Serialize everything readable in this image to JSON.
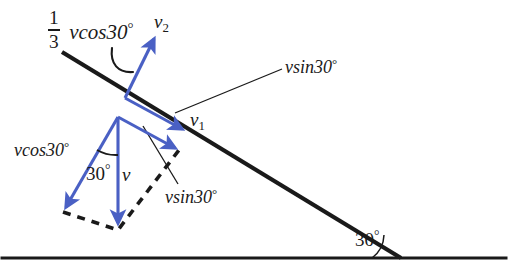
{
  "figure": {
    "width": 508,
    "height": 278,
    "background": "#ffffff"
  },
  "colors": {
    "vector_blue": "#4a60c4",
    "line_black": "#1a1a1a",
    "text": "#1a1a1a",
    "background": "#ffffff"
  },
  "labels": {
    "coefficient_numerator": "1",
    "coefficient_denominator": "3",
    "vcos30_top": "vcos30",
    "v2": "v",
    "v2_sub": "2",
    "vsin30_top": "vsin30",
    "v1": "v",
    "v1_sub": "1",
    "vcos30_left": "vcos30",
    "angle_30": "30",
    "v_main": "v",
    "vsin30_mid": "vsin30",
    "incline_angle": "30",
    "degree": "°"
  },
  "geometry": {
    "ground_line": {
      "x1": 2,
      "y1": 258,
      "x2": 506,
      "y2": 258
    },
    "incline_line": {
      "x1": 62,
      "y1": 52,
      "x2": 401,
      "y2": 258
    },
    "incline_angle_deg": 30,
    "impact_point": {
      "x": 125,
      "y": 98
    },
    "vectors": [
      {
        "name": "v2",
        "x1": 125,
        "y1": 98,
        "x2": 156,
        "y2": 35,
        "color": "#4a60c4"
      },
      {
        "name": "vsin30-upper",
        "x1": 125,
        "y1": 98,
        "x2": 186,
        "y2": 131,
        "color": "#4a60c4"
      },
      {
        "name": "v1",
        "x1": 118,
        "y1": 117,
        "x2": 179,
        "y2": 150,
        "color": "#4a60c4"
      },
      {
        "name": "v-main",
        "x1": 118,
        "y1": 117,
        "x2": 118,
        "y2": 227,
        "color": "#4a60c4"
      },
      {
        "name": "vcos30-left",
        "x1": 118,
        "y1": 117,
        "x2": 63,
        "y2": 212,
        "color": "#4a60c4"
      }
    ],
    "dashed_parallelogram": [
      {
        "x1": 63,
        "y1": 212,
        "x2": 118,
        "y2": 229
      },
      {
        "x1": 118,
        "y1": 229,
        "x2": 179,
        "y2": 150
      }
    ],
    "leader_lines": [
      {
        "name": "vsin30-top-leader",
        "x1": 282,
        "y1": 69,
        "x2": 175,
        "y2": 113
      },
      {
        "name": "vsin30-mid-leader",
        "x1": 178,
        "y1": 184,
        "x2": 143,
        "y2": 126
      }
    ],
    "arcs": [
      {
        "name": "coefficient-leader-arc"
      },
      {
        "name": "angle-30-arc"
      },
      {
        "name": "incline-angle-arc"
      }
    ]
  }
}
